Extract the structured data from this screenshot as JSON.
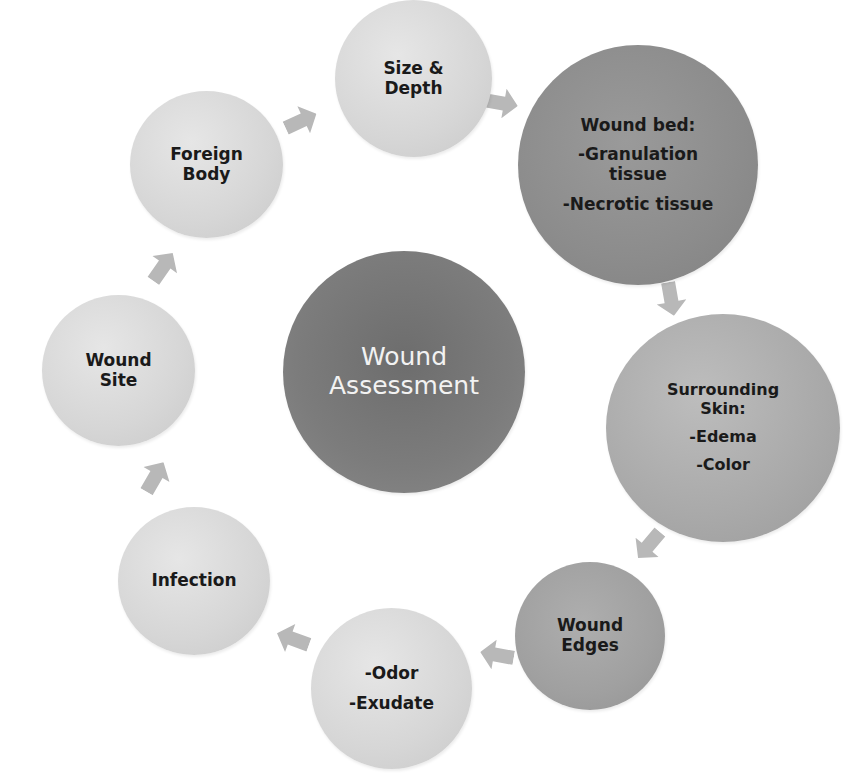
{
  "diagram": {
    "type": "cycle",
    "center": {
      "label_lines": [
        "Wound",
        "Assessment"
      ]
    },
    "nodes": [
      {
        "id": "size-depth",
        "label_lines": [
          "Size &",
          "Depth"
        ]
      },
      {
        "id": "wound-bed",
        "label_lines": [
          "Wound bed:",
          "-Granulation",
          "tissue",
          "-Necrotic tissue"
        ]
      },
      {
        "id": "surrounding-skin",
        "label_lines": [
          "Surrounding",
          "Skin:",
          "-Edema",
          "-Color"
        ]
      },
      {
        "id": "wound-edges",
        "label_lines": [
          "Wound",
          "Edges"
        ]
      },
      {
        "id": "odor-exudate",
        "label_lines": [
          "-Odor",
          "-Exudate"
        ]
      },
      {
        "id": "infection",
        "label_lines": [
          "Infection"
        ]
      },
      {
        "id": "wound-site",
        "label_lines": [
          "Wound",
          "Site"
        ]
      },
      {
        "id": "foreign-body",
        "label_lines": [
          "Foreign",
          "Body"
        ]
      }
    ],
    "edges": [
      [
        "size-depth",
        "wound-bed"
      ],
      [
        "wound-bed",
        "surrounding-skin"
      ],
      [
        "surrounding-skin",
        "wound-edges"
      ],
      [
        "wound-edges",
        "odor-exudate"
      ],
      [
        "odor-exudate",
        "infection"
      ],
      [
        "infection",
        "wound-site"
      ],
      [
        "wound-site",
        "foreign-body"
      ],
      [
        "foreign-body",
        "size-depth"
      ]
    ],
    "colors": {
      "background": "#ffffff",
      "center_fill": "#747474",
      "center_text": "#f2f2f2",
      "wound_bed_fill": "#8e8e8e",
      "surrounding_skin_fill": "#b5b5b5",
      "wound_edges_fill": "#a3a3a3",
      "light_fill": "#d9d9d9",
      "arrow_fill": "#b8b8b8",
      "text": "#1a1a1a"
    }
  }
}
